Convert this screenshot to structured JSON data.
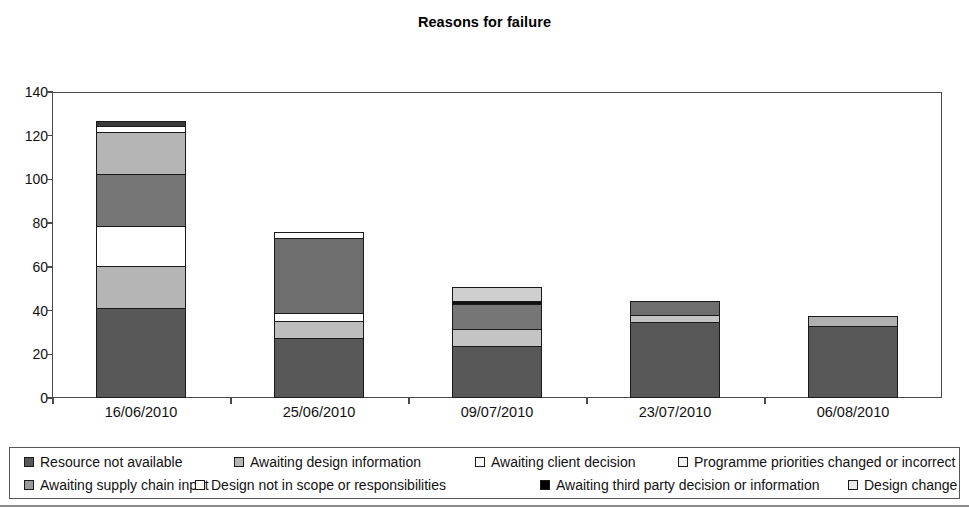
{
  "chart_data": {
    "type": "bar",
    "subtype": "stacked-bar",
    "title": "Reasons for failure",
    "xlabel": "",
    "ylabel": "",
    "ylim": [
      0,
      140
    ],
    "ytick_step": 20,
    "yticks": [
      0,
      20,
      40,
      60,
      80,
      100,
      120,
      140
    ],
    "ytick_labels": [
      "0",
      "20",
      "40",
      "60",
      "80",
      "100",
      "120",
      "140"
    ],
    "grid": false,
    "legend_position": "bottom",
    "categories": [
      "16/06/2010",
      "25/06/2010",
      "09/07/2010",
      "23/07/2010",
      "06/08/2010"
    ],
    "series": [
      {
        "name": "Resource not available",
        "color": "#585858",
        "values": [
          41,
          27.5,
          24,
          35,
          33
        ]
      },
      {
        "name": "Awaiting design information",
        "color": "#b5b5b5",
        "values": [
          20,
          0,
          0,
          0,
          0
        ]
      },
      {
        "name": "Awaiting client decision",
        "color": "#ffffff",
        "values": [
          19,
          0,
          0,
          0,
          0
        ]
      },
      {
        "name": "Programme priorities changed or incorrect",
        "color": "#ffffff",
        "values": [
          0,
          0,
          0,
          0,
          0
        ]
      },
      {
        "name": "Awaiting supply chain input",
        "color": "#767676",
        "values": [
          24,
          0,
          0,
          0,
          0
        ]
      },
      {
        "name": "Design not in scope or responsibilities",
        "color": "#ffffff",
        "values": [
          0,
          0,
          0,
          0,
          0
        ]
      },
      {
        "name": "Awaiting third party decision or information",
        "color": "#000000",
        "values": [
          0,
          0,
          0,
          0,
          0
        ]
      },
      {
        "name": "Design change",
        "color": "#cfcfcf",
        "values": [
          0,
          0,
          0,
          0,
          0
        ]
      }
    ],
    "stacks": [
      {
        "category": "16/06/2010",
        "total": 130,
        "segments": [
          {
            "label": "Resource not available",
            "value": 41,
            "color": "#585858"
          },
          {
            "label": "Awaiting design information",
            "value": 20,
            "color": "#b5b5b5"
          },
          {
            "label": "Awaiting client decision",
            "value": 19,
            "color": "#ffffff"
          },
          {
            "label": "Awaiting supply chain input",
            "value": 24,
            "color": "#767676"
          },
          {
            "label": "Design not in scope or responsibilities",
            "value": 20,
            "color": "#b5b5b5"
          },
          {
            "label": "Awaiting third party decision or information",
            "value": 3,
            "color": "#ffffff"
          },
          {
            "label": "Design change",
            "value": 3,
            "color": "#3a3a3a"
          }
        ]
      },
      {
        "category": "25/06/2010",
        "total": 78,
        "segments": [
          {
            "label": "Resource not available",
            "value": 27.5,
            "color": "#585858"
          },
          {
            "label": "Awaiting design information",
            "value": 8.5,
            "color": "#bdbdbd"
          },
          {
            "label": "Awaiting client decision",
            "value": 4,
            "color": "#ffffff"
          },
          {
            "label": "Awaiting supply chain input",
            "value": 35,
            "color": "#6e6e6e"
          },
          {
            "label": "Design change",
            "value": 3,
            "color": "#ffffff"
          }
        ]
      },
      {
        "category": "09/07/2010",
        "total": 53,
        "segments": [
          {
            "label": "Resource not available",
            "value": 24,
            "color": "#585858"
          },
          {
            "label": "Awaiting design information",
            "value": 8,
            "color": "#c4c4c4"
          },
          {
            "label": "Awaiting supply chain input",
            "value": 12,
            "color": "#767676"
          },
          {
            "label": "Awaiting third party decision or information",
            "value": 2,
            "color": "#111111"
          },
          {
            "label": "Design change",
            "value": 7,
            "color": "#cfcfcf"
          }
        ]
      },
      {
        "category": "23/07/2010",
        "total": 45.5,
        "segments": [
          {
            "label": "Resource not available",
            "value": 35,
            "color": "#585858"
          },
          {
            "label": "Awaiting design information",
            "value": 3.5,
            "color": "#c4c4c4"
          },
          {
            "label": "Awaiting supply chain input",
            "value": 7,
            "color": "#6e6e6e"
          }
        ]
      },
      {
        "category": "06/08/2010",
        "total": 38,
        "segments": [
          {
            "label": "Resource not available",
            "value": 33,
            "color": "#585858"
          },
          {
            "label": "Design change",
            "value": 5,
            "color": "#b0b0b0"
          }
        ]
      }
    ],
    "legend": [
      {
        "label": "Resource not available",
        "color": "#585858"
      },
      {
        "label": "Awaiting design information",
        "color": "#b5b5b5"
      },
      {
        "label": "Awaiting client decision",
        "color": "#ffffff"
      },
      {
        "label": "Programme priorities changed or incorrect",
        "color": "#f2f2f2"
      },
      {
        "label": "Awaiting supply chain input",
        "color": "#9a9a9a"
      },
      {
        "label": "Design not in scope or responsibilities",
        "color": "#ffffff"
      },
      {
        "label": "Awaiting third party decision or information",
        "color": "#000000"
      },
      {
        "label": "Design change",
        "color": "#e8e8e8"
      }
    ]
  },
  "axis_color": "#4a4a4a",
  "frame_color": "#555555",
  "text_color": "#111111"
}
